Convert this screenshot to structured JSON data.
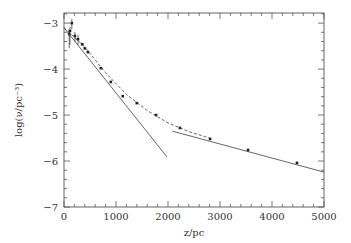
{
  "chart_data": {
    "type": "line",
    "title": "",
    "xlabel": "z/pc",
    "ylabel": "log(ν/pc⁻³)",
    "xlim": [
      0,
      5000
    ],
    "ylim": [
      -7,
      -2.78
    ],
    "xticks": [
      0,
      1000,
      2000,
      3000,
      4000,
      5000
    ],
    "xtick_labels": [
      "0",
      "1000",
      "2000",
      "3000",
      "4000",
      "5000"
    ],
    "yticks": [
      -3,
      -4,
      -5,
      -6,
      -7
    ],
    "ytick_labels": [
      "−3",
      "−4",
      "−5",
      "−6",
      "−7"
    ],
    "grid": false,
    "legend": null,
    "series": [
      {
        "name": "data points",
        "style": "points-with-errorbars",
        "x": [
          100,
          115,
          150,
          210,
          270,
          350,
          400,
          460,
          710,
          900,
          1130,
          1400,
          1770,
          2230,
          2810,
          3540,
          4480
        ],
        "y": [
          -3.24,
          -3.17,
          -3.0,
          -3.28,
          -3.35,
          -3.46,
          -3.55,
          -3.63,
          -3.98,
          -4.28,
          -4.59,
          -4.74,
          -5.0,
          -5.28,
          -5.52,
          -5.76,
          -6.04
        ]
      },
      {
        "name": "thin disk fit",
        "style": "solid",
        "x": [
          0,
          1980
        ],
        "y": [
          -3.1,
          -5.91
        ]
      },
      {
        "name": "thick disk fit",
        "style": "solid",
        "x": [
          2080,
          5000
        ],
        "y": [
          -5.35,
          -6.24
        ]
      },
      {
        "name": "combined fit",
        "style": "dashed",
        "x": [
          0,
          400,
          800,
          1200,
          1600,
          2000,
          2400,
          2800
        ],
        "y": [
          -3.1,
          -3.52,
          -4.08,
          -4.55,
          -4.9,
          -5.17,
          -5.36,
          -5.5
        ]
      }
    ]
  }
}
